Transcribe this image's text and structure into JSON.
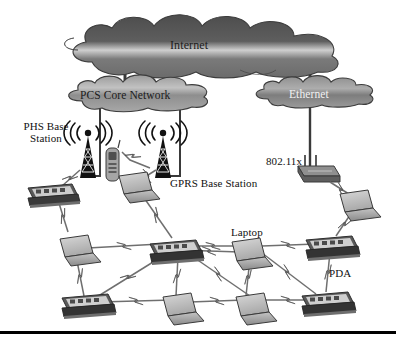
{
  "figure": {
    "background_color": "#ffffff",
    "line_color": "#2b2b2b",
    "cloud_fill_dark": "#575757",
    "cloud_fill_mid": "#8d8d8d",
    "device_fill": "#b9b9b9",
    "bottom_rule_color": "#000000"
  },
  "clouds": [
    {
      "id": "internet",
      "label": "Internet",
      "x": 68,
      "y": 24,
      "w": 272,
      "h": 52,
      "label_color": "#1c1c1c"
    },
    {
      "id": "pcs_core_network",
      "label": "PCS Core Network",
      "x": 64,
      "y": 83,
      "w": 158,
      "h": 29,
      "label_color": "#1c1c1c"
    },
    {
      "id": "ethernet",
      "label": "Ethernet",
      "x": 253,
      "y": 82,
      "w": 118,
      "h": 27,
      "label_color": "#f2f2f2"
    }
  ],
  "labels": [
    {
      "id": "phs_base_station",
      "text": "PHS Base\nStation",
      "x": 16,
      "y": 120,
      "size": 11,
      "align": "center"
    },
    {
      "id": "gprs_base_station",
      "text": "GPRS Base Station",
      "x": 170,
      "y": 177,
      "size": 11,
      "align": "left"
    },
    {
      "id": "wifi_standard",
      "text": "802.11x",
      "x": 266,
      "y": 155,
      "size": 11,
      "align": "left"
    },
    {
      "id": "laptop",
      "text": "Laptop",
      "x": 231,
      "y": 226,
      "size": 11,
      "align": "left"
    },
    {
      "id": "pda",
      "text": "PDA",
      "x": 329,
      "y": 267,
      "size": 11,
      "align": "left"
    }
  ],
  "towers": [
    {
      "id": "phs-tower",
      "name": "PHS base station tower",
      "x": 88,
      "y": 128
    },
    {
      "id": "gprs-tower",
      "name": "GPRS base station tower",
      "x": 163,
      "y": 128
    }
  ],
  "access_point": {
    "id": "wifi-access-point",
    "name": "802.11x wireless access point",
    "x": 308,
    "y": 165
  },
  "mobile_phone": {
    "id": "mobile-phone",
    "name": "Mobile handset",
    "x": 112,
    "y": 147
  },
  "devices": [
    {
      "id": "pda-1",
      "type": "pda",
      "x": 50,
      "y": 185
    },
    {
      "id": "laptop-1",
      "type": "laptop",
      "x": 127,
      "y": 175
    },
    {
      "id": "laptop-2",
      "type": "laptop",
      "x": 346,
      "y": 195
    },
    {
      "id": "laptop-3",
      "type": "laptop",
      "x": 70,
      "y": 240
    },
    {
      "id": "pda-2",
      "type": "pda",
      "x": 168,
      "y": 242
    },
    {
      "id": "laptop-4",
      "type": "laptop",
      "x": 240,
      "y": 245
    },
    {
      "id": "pda-3",
      "type": "pda",
      "x": 322,
      "y": 240
    },
    {
      "id": "pda-4",
      "type": "pda",
      "x": 80,
      "y": 298
    },
    {
      "id": "laptop-5",
      "type": "laptop",
      "x": 175,
      "y": 300
    },
    {
      "id": "laptop-6",
      "type": "laptop",
      "x": 248,
      "y": 300
    },
    {
      "id": "pda-5",
      "type": "pda",
      "x": 320,
      "y": 296
    }
  ],
  "wired_links": [
    {
      "from": "internet",
      "to": "pcs_core_network"
    },
    {
      "from": "internet",
      "to": "ethernet"
    },
    {
      "from": "ethernet",
      "to": "wifi-access-point"
    },
    {
      "from": "pcs_core_network",
      "to": "phs-tower"
    },
    {
      "from": "pcs_core_network",
      "to": "gprs-tower"
    }
  ],
  "wireless_links": [
    {
      "from": "phs-tower",
      "to": "pda-1"
    },
    {
      "from": "gprs-tower",
      "to": "mobile-phone"
    },
    {
      "from": "gprs-tower",
      "to": "laptop-1"
    },
    {
      "from": "wifi-access-point",
      "to": "laptop-2"
    }
  ],
  "bottom_rule": {
    "y": 331,
    "thickness": 3
  }
}
